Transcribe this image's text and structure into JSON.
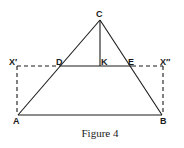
{
  "figure": {
    "caption": "Figure 4",
    "stroke_color": "#1a1a1a",
    "points": {
      "C": {
        "label": "C"
      },
      "D": {
        "label": "D"
      },
      "K": {
        "label": "K"
      },
      "E": {
        "label": "E"
      },
      "X1": {
        "label": "X′"
      },
      "X2": {
        "label": "X″"
      },
      "A": {
        "label": "A"
      },
      "B": {
        "label": "B"
      }
    },
    "segments": [
      {
        "from": "A",
        "to": "C",
        "style": "solid"
      },
      {
        "from": "B",
        "to": "C",
        "style": "solid"
      },
      {
        "from": "A",
        "to": "B",
        "style": "solid"
      },
      {
        "from": "D",
        "to": "E",
        "style": "solid"
      },
      {
        "from": "C",
        "to": "K",
        "style": "solid"
      },
      {
        "from": "X′",
        "to": "D",
        "style": "dashed"
      },
      {
        "from": "E",
        "to": "X″",
        "style": "dashed"
      },
      {
        "from": "X′",
        "to": "A",
        "style": "dashed"
      },
      {
        "from": "X″",
        "to": "B",
        "style": "dashed"
      }
    ]
  }
}
